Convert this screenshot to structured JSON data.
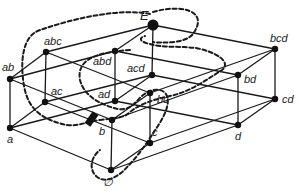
{
  "diagram": {
    "type": "hasse-lattice",
    "nodes": [
      {
        "id": "E",
        "label": "E",
        "x": 153,
        "y": 25
      },
      {
        "id": "abc",
        "label": "abc",
        "x": 46,
        "y": 52
      },
      {
        "id": "abd",
        "label": "abd",
        "x": 115,
        "y": 51
      },
      {
        "id": "acd",
        "label": "acd",
        "x": 152,
        "y": 75
      },
      {
        "id": "bcd",
        "label": "bcd",
        "x": 275,
        "y": 49
      },
      {
        "id": "ab",
        "label": "ab",
        "x": 10,
        "y": 79
      },
      {
        "id": "ac",
        "label": "ac",
        "x": 45,
        "y": 102
      },
      {
        "id": "ad",
        "label": "ad",
        "x": 115,
        "y": 101
      },
      {
        "id": "bc",
        "label": "bc",
        "x": 150,
        "y": 93
      },
      {
        "id": "bd",
        "label": "bd",
        "x": 238,
        "y": 75
      },
      {
        "id": "cd",
        "label": "cd",
        "x": 275,
        "y": 99
      },
      {
        "id": "a",
        "label": "a",
        "x": 10,
        "y": 128
      },
      {
        "id": "b",
        "label": "b",
        "x": 112,
        "y": 120
      },
      {
        "id": "c",
        "label": "c",
        "x": 150,
        "y": 143
      },
      {
        "id": "d",
        "label": "d",
        "x": 238,
        "y": 125
      },
      {
        "id": "empty",
        "label": "∅",
        "x": 111,
        "y": 170
      }
    ],
    "labels": {
      "E": "E",
      "abc": "abc",
      "abd": "abd",
      "acd": "acd",
      "bcd": "bcd",
      "ab": "ab",
      "ac": "ac",
      "ad": "ad",
      "bc": "bc",
      "bd": "bd",
      "cd": "cd",
      "a": "a",
      "b": "b",
      "c": "c",
      "d": "d",
      "empty": "∅"
    },
    "edges": [
      [
        "E",
        "abc"
      ],
      [
        "E",
        "abd"
      ],
      [
        "E",
        "acd"
      ],
      [
        "E",
        "bcd"
      ],
      [
        "abc",
        "ab"
      ],
      [
        "abc",
        "ac"
      ],
      [
        "abc",
        "bc"
      ],
      [
        "abd",
        "ab"
      ],
      [
        "abd",
        "ad"
      ],
      [
        "abd",
        "bd"
      ],
      [
        "acd",
        "ac"
      ],
      [
        "acd",
        "ad"
      ],
      [
        "acd",
        "cd"
      ],
      [
        "bcd",
        "bc"
      ],
      [
        "bcd",
        "bd"
      ],
      [
        "bcd",
        "cd"
      ],
      [
        "ab",
        "a"
      ],
      [
        "ab",
        "b"
      ],
      [
        "ac",
        "a"
      ],
      [
        "ac",
        "c"
      ],
      [
        "ad",
        "a"
      ],
      [
        "ad",
        "d"
      ],
      [
        "bc",
        "b"
      ],
      [
        "bc",
        "c"
      ],
      [
        "bd",
        "b"
      ],
      [
        "bd",
        "d"
      ],
      [
        "cd",
        "c"
      ],
      [
        "cd",
        "d"
      ],
      [
        "a",
        "empty"
      ],
      [
        "b",
        "empty"
      ],
      [
        "c",
        "empty"
      ],
      [
        "d",
        "empty"
      ]
    ],
    "marker": {
      "description": "thick black cut marker on edge near b",
      "x": 92,
      "y": 118
    },
    "dashed_regions": 2
  }
}
